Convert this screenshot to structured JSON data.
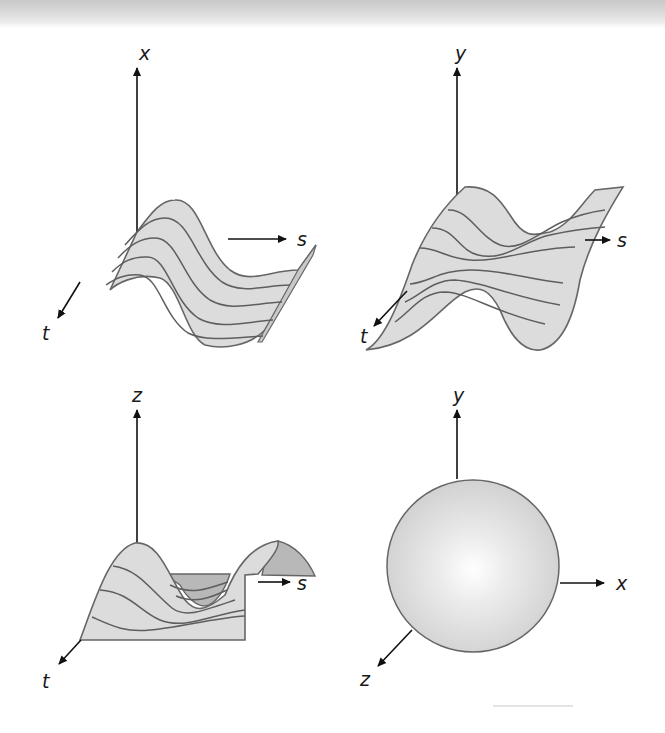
{
  "figure": {
    "panels": [
      {
        "id": "top-left",
        "description": "sinusoidal ridge surface x(s,t)",
        "axes": {
          "vertical": "x",
          "horizontal": "s",
          "depth": "t"
        }
      },
      {
        "id": "top-right",
        "description": "wavy surface y(s,t)",
        "axes": {
          "vertical": "y",
          "horizontal": "s",
          "depth": "t"
        }
      },
      {
        "id": "bottom-left",
        "description": "hill and valley surface z(s,t)",
        "axes": {
          "vertical": "z",
          "horizontal": "s",
          "depth": "t"
        }
      },
      {
        "id": "bottom-right",
        "description": "shaded sphere in xyz space",
        "axes": {
          "vertical": "y",
          "horizontal": "x",
          "depth": "z"
        }
      }
    ],
    "colors": {
      "surface_fill": "#dcdcdc",
      "surface_shadow": "#b8b8b8",
      "outline": "#666666",
      "axis": "#111111",
      "background": "#ffffff"
    }
  }
}
